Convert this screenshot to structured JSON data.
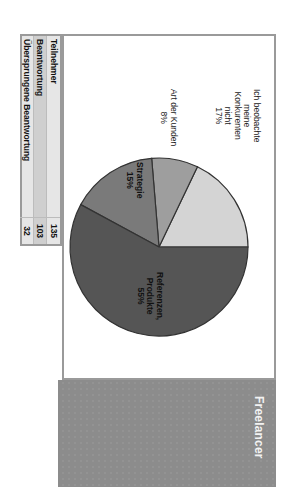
{
  "header": {
    "title": "Freelancer"
  },
  "chart_data": {
    "type": "pie",
    "title": "Freelancer",
    "slices": [
      {
        "label": "Ich beobachte meine Konkurenten nicht",
        "percent": 17,
        "color": "#d4d4d4"
      },
      {
        "label": "Art der Kunden",
        "percent": 8,
        "color": "#9e9e9e"
      },
      {
        "label": "Strategie",
        "percent": 15,
        "color": "#7a7a7a"
      },
      {
        "label": "Referenzen, Produkte",
        "percent": 55,
        "color": "#555555"
      }
    ],
    "labels_display": {
      "s0": [
        "Ich beobachte",
        "meine",
        "Konkurenten",
        "nicht",
        "17%"
      ],
      "s1": [
        "Art der Kunden",
        "8%"
      ],
      "s2": [
        "Strategie",
        "15%"
      ],
      "s3": [
        "Referenzen,",
        "Produkte",
        "55%"
      ]
    }
  },
  "stats_table": {
    "rows": [
      {
        "label": "Teilnehmer",
        "value": "135"
      },
      {
        "label": "Beantwortung",
        "value": "103"
      },
      {
        "label": "Übersprungene Beantwortung",
        "value": "32"
      }
    ]
  },
  "colors": {
    "band": "#8c8c8c",
    "frame": "#9a9a9a",
    "table_bg": "#e6e6e6"
  }
}
